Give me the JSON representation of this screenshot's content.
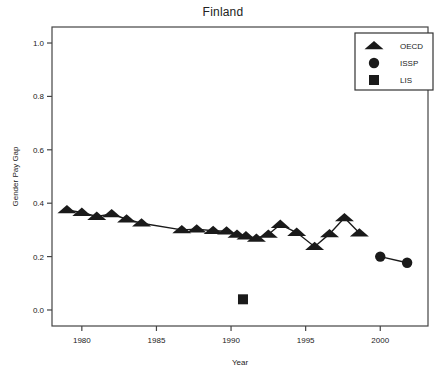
{
  "chart_data": {
    "type": "scatter",
    "title": "Finland",
    "xlabel": "Year",
    "ylabel": "Gender Pay Gap",
    "xlim": [
      1978.0,
      2003.2
    ],
    "ylim": [
      -0.06,
      1.06
    ],
    "xticks": [
      1980,
      1985,
      1990,
      1995,
      2000
    ],
    "xtick_labels": [
      "1980",
      "1985",
      "1990",
      "1995",
      "2000"
    ],
    "yticks": [
      0.0,
      0.2,
      0.4,
      0.6,
      0.8,
      1.0
    ],
    "ytick_labels": [
      "0.0",
      "0.2",
      "0.4",
      "0.6",
      "0.8",
      "1.0"
    ],
    "grid": false,
    "legend_position": "top-right",
    "marker_color": "#1a1a1a",
    "line_color": "#1a1a1a",
    "series": [
      {
        "name": "OECD",
        "marker": "triangle",
        "connected": true,
        "points": [
          {
            "x": 1979.0,
            "y": 0.375
          },
          {
            "x": 1980.0,
            "y": 0.365
          },
          {
            "x": 1981.0,
            "y": 0.35
          },
          {
            "x": 1982.0,
            "y": 0.36
          },
          {
            "x": 1983.0,
            "y": 0.34
          },
          {
            "x": 1984.0,
            "y": 0.325
          },
          {
            "x": 1986.7,
            "y": 0.3
          },
          {
            "x": 1987.7,
            "y": 0.303
          },
          {
            "x": 1988.8,
            "y": 0.297
          },
          {
            "x": 1989.7,
            "y": 0.295
          },
          {
            "x": 1990.4,
            "y": 0.283
          },
          {
            "x": 1991.0,
            "y": 0.277
          },
          {
            "x": 1991.7,
            "y": 0.268
          },
          {
            "x": 1992.5,
            "y": 0.283
          },
          {
            "x": 1993.3,
            "y": 0.32
          },
          {
            "x": 1994.4,
            "y": 0.29
          },
          {
            "x": 1995.6,
            "y": 0.237
          },
          {
            "x": 1996.6,
            "y": 0.285
          },
          {
            "x": 1997.6,
            "y": 0.345
          },
          {
            "x": 1998.6,
            "y": 0.288
          }
        ]
      },
      {
        "name": "ISSP",
        "marker": "circle",
        "connected": true,
        "points": [
          {
            "x": 2000.0,
            "y": 0.2
          },
          {
            "x": 2001.8,
            "y": 0.177
          }
        ]
      },
      {
        "name": "LIS",
        "marker": "square",
        "connected": false,
        "points": [
          {
            "x": 1990.8,
            "y": 0.04
          }
        ]
      }
    ],
    "legend": [
      {
        "label": "OECD",
        "marker": "triangle"
      },
      {
        "label": "ISSP",
        "marker": "circle"
      },
      {
        "label": "LIS",
        "marker": "square"
      }
    ]
  }
}
